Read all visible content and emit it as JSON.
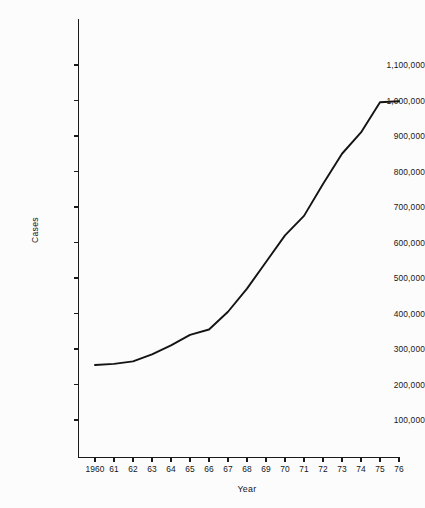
{
  "chart_data": {
    "type": "line",
    "title": "",
    "xlabel": "Year",
    "ylabel": "Cases",
    "x": [
      1960,
      1961,
      1962,
      1963,
      1964,
      1965,
      1966,
      1967,
      1968,
      1969,
      1970,
      1971,
      1972,
      1973,
      1974,
      1975,
      1976
    ],
    "xtick_labels": [
      "1960",
      "61",
      "62",
      "63",
      "64",
      "65",
      "66",
      "67",
      "68",
      "69",
      "70",
      "71",
      "72",
      "73",
      "74",
      "75",
      "76"
    ],
    "values": [
      255000,
      258000,
      265000,
      285000,
      310000,
      340000,
      355000,
      405000,
      470000,
      545000,
      620000,
      675000,
      765000,
      850000,
      910000,
      995000,
      998000
    ],
    "ytick_values": [
      100000,
      200000,
      300000,
      400000,
      500000,
      600000,
      700000,
      800000,
      900000,
      1000000,
      1100000
    ],
    "ytick_labels": [
      "100,000",
      "200,000",
      "300,000",
      "400,000",
      "500,000",
      "600,000",
      "700,000",
      "800,000",
      "900,000",
      "1,000,000",
      "1,100,000"
    ],
    "ylim": [
      0,
      1100000
    ],
    "xlim": [
      1960,
      1976
    ],
    "grid": false,
    "legend": false,
    "line_color": "#141414",
    "axis_color": "#1a1a1a",
    "background_color": "#fcfcfc"
  }
}
